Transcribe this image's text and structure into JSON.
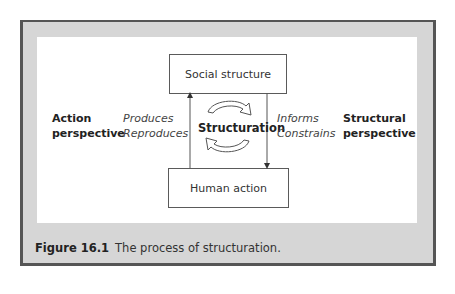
{
  "figure": {
    "nodes": {
      "top": "Social structure",
      "bottom": "Human action",
      "center": "Structuration"
    },
    "left_side": {
      "perspective_line1": "Action",
      "perspective_line2": "perspective",
      "verb1": "Produces",
      "verb2": "Reproduces"
    },
    "right_side": {
      "verb1": "Informs",
      "verb2": "Constrains",
      "perspective_line1": "Structural",
      "perspective_line2": "perspective"
    },
    "caption": {
      "number": "Figure 16.1",
      "text": "The process of structuration."
    },
    "colors": {
      "frame_border": "#555555",
      "frame_fill": "#d6d6d6",
      "panel": "#ffffff"
    }
  }
}
